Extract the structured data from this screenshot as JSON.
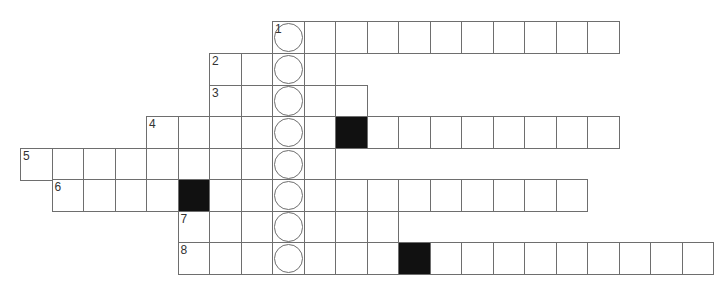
{
  "puzzle": {
    "type": "crossword",
    "cell_size": 31.5,
    "origin_x": 20,
    "row_tops": [
      21,
      53,
      84.5,
      116,
      148,
      179,
      210.5,
      242
    ],
    "circled_column": 8,
    "rows": [
      {
        "number": "1",
        "start_col": 8,
        "end_col": 18,
        "blocks": []
      },
      {
        "number": "2",
        "start_col": 6,
        "end_col": 9,
        "blocks": []
      },
      {
        "number": "3",
        "start_col": 6,
        "end_col": 10,
        "blocks": []
      },
      {
        "number": "4",
        "start_col": 4,
        "end_col": 18,
        "blocks": [
          10
        ]
      },
      {
        "number": "5",
        "start_col": 0,
        "end_col": 9,
        "blocks": []
      },
      {
        "number": "6",
        "start_col": 1,
        "end_col": 17,
        "blocks": [
          5
        ]
      },
      {
        "number": "7",
        "start_col": 5,
        "end_col": 11,
        "blocks": []
      },
      {
        "number": "8",
        "start_col": 5,
        "end_col": 21,
        "blocks": [
          12
        ]
      }
    ]
  }
}
